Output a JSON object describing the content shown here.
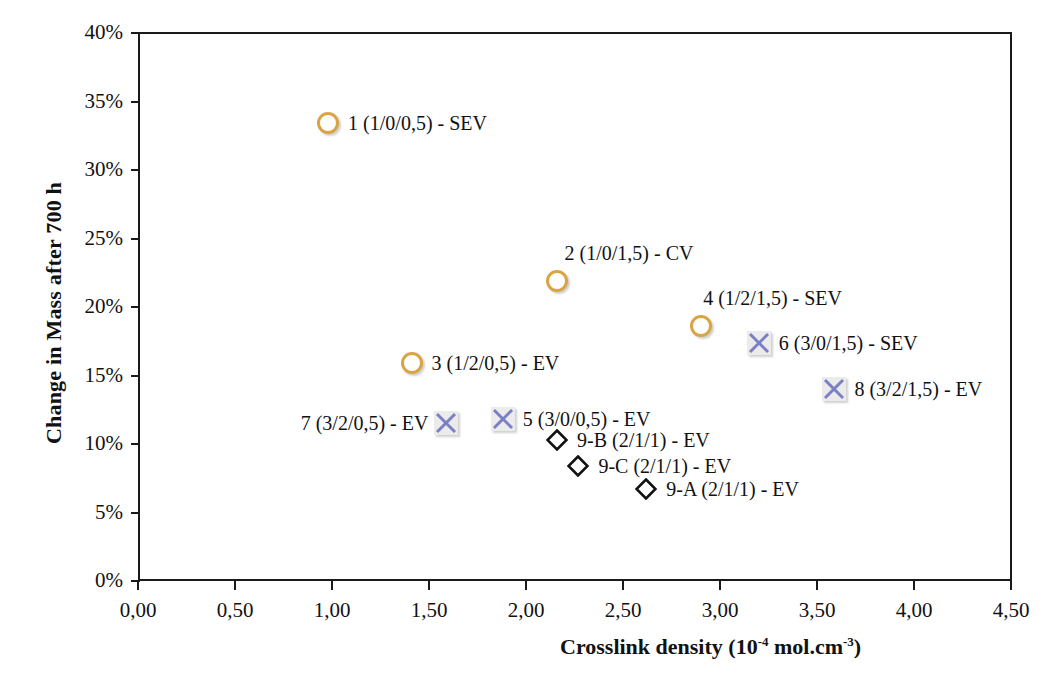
{
  "chart_data": {
    "type": "scatter",
    "title": "",
    "xlabel_prefix": "Crosslink density (10",
    "xlabel_sup1": "-4",
    "xlabel_mid": " mol.cm",
    "xlabel_sup2": "-3",
    "xlabel_suffix": ")",
    "xlabel": "Crosslink density (10-4 mol.cm-3)",
    "ylabel": "Change in Mass after 700 h",
    "xlim": [
      0.0,
      4.5
    ],
    "ylim": [
      0.0,
      0.4
    ],
    "grid": false,
    "legend": "none (labels annotated at points)",
    "xticks": [
      "0,00",
      "0,50",
      "1,00",
      "1,50",
      "2,00",
      "2,50",
      "3,00",
      "3,50",
      "4,00",
      "4,50"
    ],
    "xtick_values": [
      0.0,
      0.5,
      1.0,
      1.5,
      2.0,
      2.5,
      3.0,
      3.5,
      4.0,
      4.5
    ],
    "yticks": [
      "0%",
      "5%",
      "10%",
      "15%",
      "20%",
      "25%",
      "30%",
      "35%",
      "40%"
    ],
    "ytick_values": [
      0,
      5,
      10,
      15,
      20,
      25,
      30,
      35,
      40
    ],
    "series": [
      {
        "name": "circle-series",
        "marker": "circle",
        "color": "#d9a441",
        "points": [
          {
            "id": "p1",
            "label": "1 (1/0/0,5) - SEV",
            "x": 0.98,
            "y": 33.4,
            "label_side": "right"
          },
          {
            "id": "p2",
            "label": "2 (1/0/1,5) - CV",
            "x": 2.16,
            "y": 21.9,
            "label_side": "above"
          },
          {
            "id": "p3",
            "label": "3 (1/2/0,5) - EV",
            "x": 1.41,
            "y": 15.9,
            "label_side": "right"
          },
          {
            "id": "p4",
            "label": "4 (1/2/1,5) - SEV",
            "x": 2.9,
            "y": 18.6,
            "label_side": "above"
          }
        ]
      },
      {
        "name": "x-marker-series",
        "marker": "x-in-square",
        "color": "#7b7fc4",
        "points": [
          {
            "id": "p5",
            "label": "5 (3/0/0,5) - EV",
            "x": 1.88,
            "y": 11.8,
            "label_side": "right"
          },
          {
            "id": "p6",
            "label": "6 (3/0/1,5) - SEV",
            "x": 3.2,
            "y": 17.4,
            "label_side": "right"
          },
          {
            "id": "p7",
            "label": "7 (3/2/0,5) - EV",
            "x": 1.59,
            "y": 11.5,
            "label_side": "left"
          },
          {
            "id": "p8",
            "label": "8 (3/2/1,5) - EV",
            "x": 3.59,
            "y": 14.0,
            "label_side": "right"
          }
        ]
      },
      {
        "name": "diamond-series",
        "marker": "diamond",
        "color": "#111111",
        "points": [
          {
            "id": "p9b",
            "label": "9-B (2/1/1) - EV",
            "x": 2.16,
            "y": 10.3,
            "label_side": "right"
          },
          {
            "id": "p9c",
            "label": "9-C (2/1/1) - EV",
            "x": 2.27,
            "y": 8.4,
            "label_side": "right"
          },
          {
            "id": "p9a",
            "label": "9-A (2/1/1) - EV",
            "x": 2.62,
            "y": 6.7,
            "label_side": "right"
          }
        ]
      }
    ]
  },
  "artifact": {
    "text": ""
  }
}
